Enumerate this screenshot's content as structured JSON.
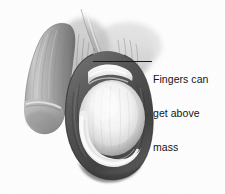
{
  "figure": {
    "type": "anatomical-illustration",
    "background_color": "#ffffff",
    "width": 225,
    "height": 194,
    "rendering": "grayscale halftone line-and-wash medical drawing"
  },
  "annotation": {
    "leader_line": {
      "color": "#1a1a1a",
      "orientation": "horizontal",
      "start_x": 93,
      "end_x": 152,
      "y": 62
    },
    "label": {
      "color": "#141414",
      "lines": [
        "Fingers can",
        "get above",
        "mass"
      ],
      "full_text": "Fingers can get above mass"
    }
  },
  "palette": {
    "background": "#ffffff",
    "shadow_dark": "#3a3a3a",
    "tissue_mid": "#8d8d8d",
    "tissue_light": "#c9c9c9",
    "mass_highlight": "#f2f2f2",
    "outline": "#2b2b2b",
    "label_text": "#141414"
  },
  "structures": [
    {
      "name": "penile-shaft",
      "region": "upper-left",
      "tone": "mid-gray"
    },
    {
      "name": "spermatic-cord",
      "region": "top-center",
      "tone": "light-gray"
    },
    {
      "name": "scrotal-sac",
      "region": "center-lower",
      "tone": "dark-gray"
    },
    {
      "name": "mass",
      "region": "center",
      "tone": "bright-highlight"
    },
    {
      "name": "epididymis-fold",
      "region": "lower-center",
      "tone": "light-gray"
    }
  ]
}
